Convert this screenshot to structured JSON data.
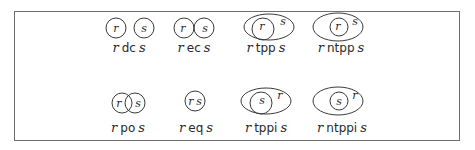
{
  "figure": {
    "type": "RCC8 region connection calculus relations",
    "relations": [
      {
        "id": "dc",
        "subject": "r",
        "relation": "dc",
        "object": "s",
        "row": 1
      },
      {
        "id": "ec",
        "subject": "r",
        "relation": "ec",
        "object": "s",
        "row": 1
      },
      {
        "id": "tpp",
        "subject": "r",
        "relation": "tpp",
        "object": "s",
        "row": 1
      },
      {
        "id": "ntpp",
        "subject": "r",
        "relation": "ntpp",
        "object": "s",
        "row": 1
      },
      {
        "id": "po",
        "subject": "r",
        "relation": "po",
        "object": "s",
        "row": 2
      },
      {
        "id": "eq",
        "subject": "r",
        "relation": "eq",
        "object": "s",
        "row": 2
      },
      {
        "id": "tppi",
        "subject": "r",
        "relation": "tppi",
        "object": "s",
        "row": 2
      },
      {
        "id": "ntppi",
        "subject": "r",
        "relation": "ntppi",
        "object": "s",
        "row": 2
      }
    ],
    "region_labels": {
      "dc": [
        "r",
        "s"
      ],
      "ec": [
        "r",
        "s"
      ],
      "tpp": [
        "r",
        "s"
      ],
      "ntpp": [
        "r",
        "s"
      ],
      "po": [
        "r",
        "s"
      ],
      "eq": [
        "r",
        "s"
      ],
      "tppi": [
        "s",
        "r"
      ],
      "ntppi": [
        "s",
        "r"
      ]
    }
  }
}
